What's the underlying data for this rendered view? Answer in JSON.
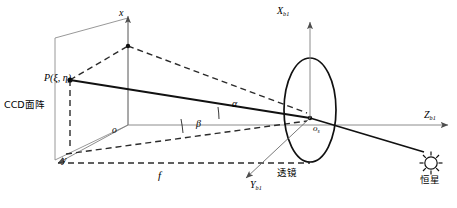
{
  "figure": {
    "kind": "optical-star-sensor-imaging-geometry",
    "background_color": "#ffffff",
    "stroke_color": "#000000",
    "axis_color": "#808080",
    "dash_color": "#333333"
  },
  "labels": {
    "ccd_plane": "CCD面阵",
    "image_point": "P(ξ, η)",
    "image_origin": "o",
    "image_axis_x": "x",
    "image_axis_y": "y",
    "focal_length": "f",
    "lens": "透镜",
    "lens_origin_base": "o",
    "lens_origin_sub": "s",
    "body_axis_x_base": "X",
    "body_axis_x_sub": "b1",
    "body_axis_y_base": "Y",
    "body_axis_y_sub": "b1",
    "body_axis_z_base": "Z",
    "body_axis_z_sub": "b1",
    "angle_alpha": "α",
    "angle_beta": "β",
    "star": "恒星",
    "star_icon": "sun-star-icon"
  },
  "geometry": {
    "ccd_plane_corners": [
      [
        55,
        160
      ],
      [
        55,
        38
      ],
      [
        128,
        18
      ],
      [
        128,
        125
      ]
    ],
    "image_origin_point": [
      128,
      125
    ],
    "image_point_P": [
      70,
      80
    ],
    "lens_center": [
      310,
      118
    ],
    "lens_ellipse_rx": 26,
    "lens_ellipse_ry": 52,
    "star_position": [
      430,
      162
    ],
    "alpha_deg": 12,
    "beta_deg": 14
  }
}
